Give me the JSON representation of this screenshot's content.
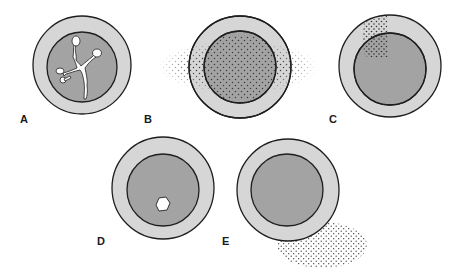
{
  "figure": {
    "colors": {
      "outer_ring": "#d6d6d6",
      "inner_core": "#a3a3a3",
      "stroke": "#1e1e1e",
      "dots": "#3a3a3a",
      "lesion": "#ffffff"
    },
    "panels": [
      {
        "id": "A",
        "label": "A",
        "feature": "branching white crack-like cavity in core"
      },
      {
        "id": "B",
        "label": "B",
        "feature": "diffuse stippling across core and extending beyond ring on both sides"
      },
      {
        "id": "C",
        "label": "C",
        "feature": "localized stippled wedge at upper-left of ring and core"
      },
      {
        "id": "D",
        "label": "D",
        "feature": "small hexagonal white cavity in lower core"
      },
      {
        "id": "E",
        "label": "E",
        "feature": "stippled region outside ring at lower-right"
      }
    ]
  }
}
